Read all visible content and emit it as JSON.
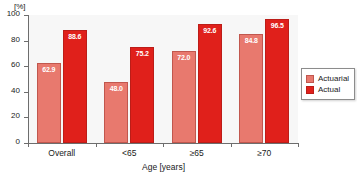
{
  "chart_data": {
    "type": "bar",
    "title": "",
    "subtitle": "",
    "xlabel": "Age [years]",
    "ylabel": "",
    "y_unit": "[%]",
    "categories": [
      "Overall",
      "<65",
      "≥65",
      "≥70"
    ],
    "series": [
      {
        "name": "Actuarial",
        "color": "#e8796e",
        "values": [
          62.9,
          48.0,
          72.0,
          84.8
        ],
        "labels": [
          "62.9",
          "48.0",
          "72.0",
          "84.8"
        ]
      },
      {
        "name": "Actual",
        "color": "#e0201b",
        "values": [
          88.6,
          75.2,
          92.6,
          96.5
        ],
        "labels": [
          "88.6",
          "75.2",
          "92.6",
          "96.5"
        ]
      }
    ],
    "ylim": [
      0,
      100
    ],
    "yticks": [
      0,
      20,
      40,
      60,
      80,
      100
    ],
    "ytick_labels": [
      "0",
      "20",
      "40",
      "60",
      "80",
      "100"
    ],
    "grid": false,
    "legend_position": "right",
    "plot_background": "#f7f7f7"
  }
}
